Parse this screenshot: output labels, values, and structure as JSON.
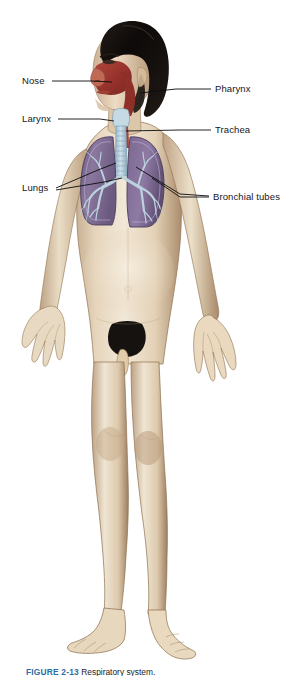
{
  "figure": {
    "background_color": "#ffffff",
    "width": 308,
    "height": 676
  },
  "caption": {
    "number": "FIGURE 2-13",
    "text": "Respiratory system."
  },
  "labels": [
    {
      "id": "nose",
      "text": "Nose",
      "side": "left",
      "text_x": 22,
      "text_y": 76,
      "leader": [
        [
          52,
          81
        ],
        [
          92,
          81
        ],
        [
          112,
          82
        ]
      ]
    },
    {
      "id": "larynx",
      "text": "Larynx",
      "side": "left",
      "text_x": 22,
      "text_y": 114,
      "leader": [
        [
          58,
          119
        ],
        [
          100,
          119
        ],
        [
          114,
          121
        ]
      ]
    },
    {
      "id": "lungs",
      "text": "Lungs",
      "side": "left",
      "text_x": 22,
      "text_y": 183,
      "leader_a": [
        [
          56,
          188
        ],
        [
          98,
          170
        ],
        [
          116,
          163
        ]
      ],
      "leader_b": [
        [
          56,
          190
        ],
        [
          104,
          182
        ],
        [
          122,
          178
        ]
      ]
    },
    {
      "id": "pharynx",
      "text": "Pharynx",
      "side": "right",
      "text_x": 215,
      "text_y": 84,
      "leader": [
        [
          211,
          89
        ],
        [
          176,
          89
        ],
        [
          140,
          93
        ]
      ]
    },
    {
      "id": "trachea",
      "text": "Trachea",
      "side": "right",
      "text_x": 215,
      "text_y": 125,
      "leader": [
        [
          211,
          130
        ],
        [
          180,
          130
        ],
        [
          126,
          131
        ]
      ]
    },
    {
      "id": "bronchial-tubes",
      "text": "Bronchial tubes",
      "side": "right",
      "text_x": 213,
      "text_y": 192,
      "leader_a": [
        [
          209,
          197
        ],
        [
          180,
          197
        ],
        [
          152,
          178
        ]
      ],
      "leader_b": [
        [
          209,
          197
        ],
        [
          180,
          195
        ],
        [
          136,
          167
        ]
      ]
    }
  ],
  "anatomy": {
    "skin_color": "#e9d9c1",
    "skin_shadow": "#c7ae92",
    "skin_deep_shadow": "#9b7f62",
    "skin_highlight": "#f4ead9",
    "hair_color": "#120e0c",
    "hair_highlight": "#3a2f2a",
    "lung_color": "#7e6a95",
    "lung_shadow": "#5f4f74",
    "lung_highlight": "#9b88b0",
    "lung_outline": "#4a3d5c",
    "bronchi_color": "#b9cfdc",
    "bronchi_stroke": "#8fb0c4",
    "trachea_color": "#b7cfdd",
    "nasal_passage_color": "#a8362c",
    "pharynx_color": "#9e3a30",
    "mucosa_color": "#c25a4a",
    "leader_color": "#0b0b0d",
    "parts": [
      "nose",
      "pharynx",
      "larynx",
      "trachea",
      "bronchial tubes",
      "lungs"
    ]
  }
}
